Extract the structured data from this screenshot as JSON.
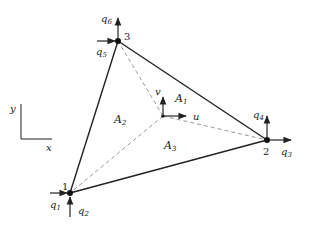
{
  "diagram": {
    "type": "triangular-finite-element",
    "colors": {
      "stroke": "#222222",
      "dashed": "#888888",
      "background": "#ffffff"
    },
    "axes": {
      "x_label": "x",
      "y_label": "y"
    },
    "nodes": [
      {
        "id": "1",
        "label": "1",
        "x": 70,
        "y": 193,
        "dof_x": "q",
        "dof_x_sub": "1",
        "dof_y": "q",
        "dof_y_sub": "2"
      },
      {
        "id": "2",
        "label": "2",
        "x": 267,
        "y": 140,
        "dof_x": "q",
        "dof_x_sub": "3",
        "dof_y": "q",
        "dof_y_sub": "4"
      },
      {
        "id": "3",
        "label": "3",
        "x": 118,
        "y": 41,
        "dof_x": "q",
        "dof_x_sub": "5",
        "dof_y": "q",
        "dof_y_sub": "6"
      }
    ],
    "interior_point": {
      "x": 163,
      "y": 116,
      "u_label": "u",
      "v_label": "v"
    },
    "areas": [
      {
        "name": "A",
        "sub": "1"
      },
      {
        "name": "A",
        "sub": "2"
      },
      {
        "name": "A",
        "sub": "3"
      }
    ]
  }
}
